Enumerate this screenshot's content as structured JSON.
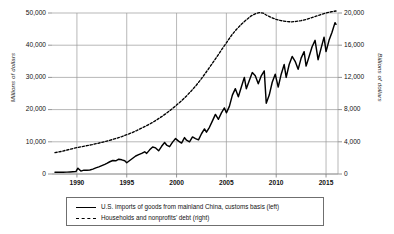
{
  "chart_data": {
    "type": "line",
    "title": "",
    "subtitle": "",
    "xlabel": "",
    "ylabel": "Millions of dollars",
    "ylabel_right": "Billions of dollars",
    "grid": true,
    "legend_position": "bottom",
    "xlim": [
      1987.5,
      2016.2
    ],
    "ylim": [
      0,
      50000
    ],
    "ylim_right": [
      0,
      20000
    ],
    "xticks": [
      1990,
      1995,
      2000,
      2005,
      2010,
      2015
    ],
    "xtick_labels": [
      "1990",
      "1995",
      "2000",
      "2005",
      "2010",
      "2015"
    ],
    "yticks_left": [
      0,
      10000,
      20000,
      30000,
      40000,
      50000
    ],
    "ytick_labels_left": [
      "0",
      "10,000",
      "20,000",
      "30,000",
      "40,000",
      "50,000"
    ],
    "yticks_right": [
      0,
      4000,
      8000,
      12000,
      16000,
      20000
    ],
    "ytick_labels_right": [
      "0",
      "4,000",
      "8,000",
      "12,000",
      "16,000",
      "20,000"
    ],
    "series": [
      {
        "name": "U.S. imports of goods from mainland China, customs basis (left)",
        "axis": "left",
        "style": "solid",
        "color": "#000000",
        "units": "Millions of dollars",
        "x": [
          1987.8,
          1988.2,
          1988.6,
          1989.0,
          1989.3,
          1989.6,
          1989.9,
          1990.1,
          1990.4,
          1990.7,
          1991.0,
          1991.3,
          1991.6,
          1991.9,
          1992.2,
          1992.5,
          1992.8,
          1993.0,
          1993.3,
          1993.6,
          1993.9,
          1994.2,
          1994.5,
          1994.8,
          1995.0,
          1995.3,
          1995.6,
          1995.9,
          1996.2,
          1996.5,
          1996.8,
          1997.0,
          1997.3,
          1997.6,
          1997.9,
          1998.2,
          1998.5,
          1998.8,
          1999.0,
          1999.3,
          1999.6,
          1999.9,
          2000.2,
          2000.5,
          2000.8,
          2001.0,
          2001.3,
          2001.6,
          2001.9,
          2002.2,
          2002.5,
          2002.8,
          2003.0,
          2003.3,
          2003.6,
          2003.9,
          2004.2,
          2004.5,
          2004.8,
          2005.0,
          2005.3,
          2005.6,
          2005.9,
          2006.2,
          2006.5,
          2006.8,
          2007.0,
          2007.3,
          2007.6,
          2007.9,
          2008.2,
          2008.5,
          2008.8,
          2009.0,
          2009.3,
          2009.6,
          2009.9,
          2010.2,
          2010.5,
          2010.8,
          2011.0,
          2011.3,
          2011.6,
          2011.9,
          2012.2,
          2012.5,
          2012.8,
          2013.0,
          2013.3,
          2013.6,
          2013.9,
          2014.2,
          2014.5,
          2014.8,
          2015.0,
          2015.3,
          2015.6,
          2015.9,
          2016.0
        ],
        "values": [
          520,
          540,
          560,
          590,
          640,
          700,
          760,
          1800,
          900,
          1200,
          1150,
          1250,
          1500,
          1900,
          2200,
          2600,
          3000,
          3300,
          3800,
          4200,
          4100,
          4600,
          4400,
          4100,
          3500,
          4200,
          4900,
          5600,
          6000,
          6400,
          6900,
          6400,
          7500,
          8400,
          8100,
          7200,
          8600,
          9800,
          9000,
          8500,
          9900,
          11000,
          10200,
          9600,
          11300,
          10500,
          10000,
          11500,
          11000,
          10600,
          12500,
          14000,
          13000,
          14500,
          16500,
          18500,
          17000,
          19000,
          20500,
          19000,
          21000,
          24500,
          26500,
          24000,
          27000,
          30000,
          26500,
          29000,
          31500,
          30500,
          28000,
          30500,
          32000,
          22000,
          24500,
          28500,
          31000,
          27000,
          31000,
          34000,
          30000,
          34000,
          36500,
          35000,
          32500,
          36000,
          38000,
          33500,
          36500,
          39500,
          41500,
          35500,
          39000,
          42500,
          38000,
          41500,
          44000,
          47000,
          46500
        ]
      },
      {
        "name": "Households and nonprofits' debt (right)",
        "axis": "right",
        "style": "dashed",
        "color": "#000000",
        "units": "Billions of dollars",
        "x": [
          1987.8,
          1988.5,
          1989.0,
          1989.5,
          1990.0,
          1990.5,
          1991.0,
          1991.5,
          1992.0,
          1992.5,
          1993.0,
          1993.5,
          1994.0,
          1994.5,
          1995.0,
          1995.5,
          1996.0,
          1996.5,
          1997.0,
          1997.5,
          1998.0,
          1998.5,
          1999.0,
          1999.5,
          2000.0,
          2000.5,
          2001.0,
          2001.5,
          2002.0,
          2002.5,
          2003.0,
          2003.5,
          2004.0,
          2004.5,
          2005.0,
          2005.5,
          2006.0,
          2006.5,
          2007.0,
          2007.5,
          2008.0,
          2008.3,
          2008.7,
          2009.0,
          2009.5,
          2010.0,
          2010.5,
          2011.0,
          2011.5,
          2012.0,
          2012.5,
          2013.0,
          2013.5,
          2014.0,
          2014.5,
          2015.0,
          2015.5,
          2016.0
        ],
        "values": [
          2650,
          2820,
          2980,
          3130,
          3280,
          3400,
          3520,
          3640,
          3780,
          3930,
          4090,
          4260,
          4450,
          4650,
          4880,
          5120,
          5400,
          5700,
          6010,
          6340,
          6720,
          7120,
          7560,
          8040,
          8560,
          9100,
          9700,
          10350,
          11060,
          11850,
          12700,
          13580,
          14480,
          15400,
          16300,
          17200,
          17950,
          18600,
          19150,
          19650,
          19950,
          20050,
          19980,
          19750,
          19450,
          19200,
          19050,
          18950,
          18900,
          18950,
          19050,
          19200,
          19400,
          19600,
          19800,
          20000,
          20150,
          20250
        ]
      }
    ]
  },
  "legend": {
    "entries": [
      {
        "label": "U.S. imports of goods from mainland China, customs basis (left)",
        "style": "solid"
      },
      {
        "label": "Households and nonprofits' debt (right)",
        "style": "dashed"
      }
    ]
  }
}
